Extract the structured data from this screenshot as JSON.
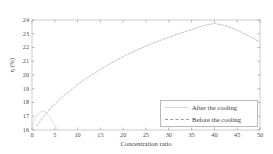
{
  "chart_data": {
    "type": "line",
    "title": "",
    "xlabel": "Concentration ratio",
    "ylabel": "η (%)",
    "xlim": [
      0,
      50
    ],
    "ylim": [
      16,
      24
    ],
    "xticks": [
      0,
      5,
      10,
      15,
      20,
      25,
      30,
      35,
      40,
      45,
      50
    ],
    "yticks": [
      16,
      17,
      18,
      19,
      20,
      21,
      22,
      23,
      24
    ],
    "grid": false,
    "legend_position": "lower right",
    "series": [
      {
        "name": "After the cooling",
        "style": "solid",
        "color": "#d8d8d8",
        "x": [
          0,
          0.4,
          0.8,
          1.2,
          1.6,
          2.0,
          2.5,
          3.0,
          3.4,
          3.8,
          4.2,
          4.6,
          5.0,
          5.4,
          5.7
        ],
        "y": [
          16.3,
          16.62,
          16.88,
          17.08,
          17.24,
          17.33,
          17.36,
          17.3,
          17.18,
          17.0,
          16.8,
          16.58,
          16.35,
          16.12,
          16.0
        ]
      },
      {
        "name": "Before the cooling",
        "style": "dashed",
        "color": "#c2c2c2",
        "x": [
          1,
          2,
          4,
          6,
          8,
          10,
          12,
          14,
          16,
          18,
          20,
          22,
          24,
          26,
          28,
          30,
          32,
          34,
          36,
          38,
          40,
          42,
          44,
          46,
          48,
          50
        ],
        "y": [
          16.3,
          16.75,
          17.55,
          18.2,
          18.78,
          19.3,
          19.78,
          20.2,
          20.6,
          20.98,
          21.34,
          21.66,
          21.96,
          22.24,
          22.5,
          22.74,
          22.98,
          23.2,
          23.42,
          23.62,
          23.75,
          23.62,
          23.4,
          23.1,
          22.76,
          22.4
        ]
      }
    ]
  },
  "axes": {
    "frame_color": "#bdbdbd",
    "tick_color": "#8a8a8a"
  },
  "legend": {
    "entries": [
      {
        "label": "After the cooling"
      },
      {
        "label": "Before the cooling"
      }
    ]
  }
}
